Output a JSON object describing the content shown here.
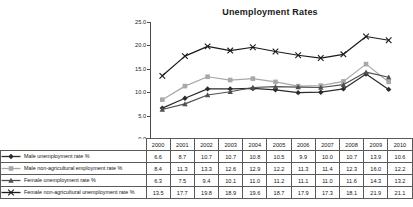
{
  "chart": {
    "title": "Unemployment Rates"
  },
  "chart_data": {
    "type": "line",
    "title": "Unemployment Rates",
    "xlabel": "",
    "ylabel": "",
    "ylim": [
      0.0,
      25.0
    ],
    "yticks": [
      "0.0",
      "5.0",
      "10.0",
      "15.0",
      "20.0",
      "25.0"
    ],
    "ytick_values": [
      0.0,
      5.0,
      10.0,
      15.0,
      20.0,
      25.0
    ],
    "grid": false,
    "legend_position": "table-left",
    "categories": [
      "2000",
      "2001",
      "2002",
      "2003",
      "2004",
      "2005",
      "2006",
      "2007",
      "2008",
      "2009",
      "2010"
    ],
    "series": [
      {
        "name": "Male unemployment rate %",
        "color": "#2b2b2b",
        "marker": "diamond",
        "values": [
          6.6,
          8.7,
          10.7,
          10.7,
          10.8,
          10.5,
          9.9,
          10.0,
          10.7,
          13.9,
          10.6
        ],
        "labels": [
          "6.6",
          "8.7",
          "10.7",
          "10.7",
          "10.8",
          "10.5",
          "9.9",
          "10.0",
          "10.7",
          "13.9",
          "10.6"
        ]
      },
      {
        "name": "Male non-agricultural employment rate %",
        "color": "#a8a8a8",
        "marker": "square",
        "values": [
          8.4,
          11.3,
          13.3,
          12.6,
          12.9,
          12.2,
          11.3,
          11.4,
          12.3,
          16.0,
          12.2
        ],
        "labels": [
          "8.4",
          "11.3",
          "13.3",
          "12.6",
          "12.9",
          "12.2",
          "11.3",
          "11.4",
          "12.3",
          "16.0",
          "12.2"
        ]
      },
      {
        "name": "Female unemployment rate %",
        "color": "#4f4f4f",
        "marker": "triangle",
        "values": [
          6.3,
          7.5,
          9.4,
          10.1,
          11.0,
          11.2,
          11.1,
          11.0,
          11.6,
          14.3,
          13.2
        ],
        "labels": [
          "6.3",
          "7.5",
          "9.4",
          "10.1",
          "11.0",
          "11.2",
          "11.1",
          "11.0",
          "11.6",
          "14.3",
          "13.2"
        ]
      },
      {
        "name": "Female non-agricultural unemployment rate %",
        "color": "#1a1a1a",
        "marker": "cross",
        "values": [
          13.5,
          17.7,
          19.8,
          18.9,
          19.6,
          18.7,
          17.9,
          17.3,
          18.1,
          21.9,
          21.1
        ],
        "labels": [
          "13.5",
          "17.7",
          "19.8",
          "18.9",
          "19.6",
          "18.7",
          "17.9",
          "17.3",
          "18.1",
          "21.9",
          "21.1"
        ]
      }
    ]
  }
}
